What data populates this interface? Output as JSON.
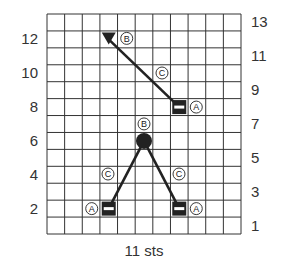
{
  "diagram": {
    "type": "stitch-chart",
    "columns": 11,
    "rows": 13,
    "caption": "11 sts",
    "left_row_labels": [
      "12",
      "10",
      "8",
      "6",
      "4",
      "2"
    ],
    "left_row_numbers": [
      12,
      10,
      8,
      6,
      4,
      2
    ],
    "right_row_labels": [
      "13",
      "11",
      "9",
      "7",
      "5",
      "3",
      "1"
    ],
    "right_row_numbers": [
      13,
      11,
      9,
      7,
      5,
      3,
      1
    ],
    "colors": {
      "grid": "#333333",
      "symbol": "#222222",
      "background": "#ffffff"
    },
    "symbols": [
      {
        "id": "triangle",
        "shape": "down-triangle",
        "col": 4,
        "row": 12,
        "label": "B",
        "label_side": "right"
      },
      {
        "id": "box-upper",
        "shape": "black-box-white-dash",
        "col": 8,
        "row": 8,
        "label": "A",
        "label_side": "right"
      },
      {
        "id": "dot",
        "shape": "filled-circle",
        "col": 6,
        "row": 6,
        "label": "B",
        "label_side": "above"
      },
      {
        "id": "box-lower-left",
        "shape": "black-box-white-dash",
        "col": 4,
        "row": 2,
        "label": "A",
        "label_side": "left"
      },
      {
        "id": "box-lower-right",
        "shape": "black-box-white-dash",
        "col": 8,
        "row": 2,
        "label": "A",
        "label_side": "right"
      }
    ],
    "connectors": [
      {
        "from": "triangle",
        "to": "box-upper",
        "label": "C"
      },
      {
        "from": "dot",
        "to": "box-lower-left",
        "label": "C"
      },
      {
        "from": "dot",
        "to": "box-lower-right",
        "label": "C"
      }
    ],
    "circled_labels": {
      "a": "A",
      "b": "B",
      "c": "C"
    }
  }
}
